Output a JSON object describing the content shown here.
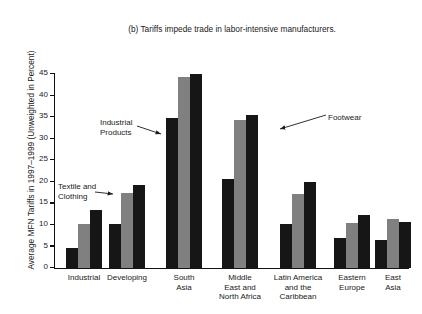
{
  "chart_data": {
    "type": "bar",
    "title": "(b) Tariffs impede trade in labor-intensive manufacturers.",
    "xlabel": "",
    "ylabel": "Average MFN Tariffs in 1997–1999 (Unweighted in Percent)",
    "ylim": [
      0,
      45
    ],
    "ytick_step": 5,
    "yticks": [
      45,
      40,
      35,
      30,
      25,
      20,
      15,
      10,
      5,
      0
    ],
    "ytick_labels": [
      "45",
      "40",
      "35",
      "30",
      "25",
      "20",
      "15",
      "10",
      "5",
      "0"
    ],
    "grid": false,
    "legend_position": "none-annotated",
    "categories": [
      "Industrial",
      "Developing",
      "South Asia",
      "Middle East and North Africa",
      "Latin America and the Caribbean",
      "Eastern Europe",
      "East Asia"
    ],
    "category_label_lines": [
      [
        "Industrial"
      ],
      [
        "Developing"
      ],
      [
        "South",
        "Asia"
      ],
      [
        "Middle",
        "East and",
        "North Africa"
      ],
      [
        "Latin America",
        "and the",
        "Caribbean"
      ],
      [
        "Eastern",
        "Europe"
      ],
      [
        "East",
        "Asia"
      ]
    ],
    "series": [
      {
        "name": "Industrial Products",
        "color": "#161616",
        "values": [
          4.5,
          10.0,
          34.8,
          20.6,
          10.0,
          6.8,
          6.3
        ]
      },
      {
        "name": "Textile and Clothing",
        "color": "#808080",
        "values": [
          10.1,
          17.4,
          44.2,
          34.3,
          17.0,
          10.4,
          11.2
        ]
      },
      {
        "name": "Footwear",
        "color": "#161616",
        "values": [
          13.3,
          19.1,
          45.0,
          35.4,
          19.9,
          12.3,
          10.6
        ]
      }
    ],
    "annotations": [
      {
        "text_lines": [
          "Industrial",
          "Products"
        ],
        "points_to_series": "Industrial Products",
        "points_to_category": "South Asia"
      },
      {
        "text_lines": [
          "Textile and",
          "Clothing"
        ],
        "points_to_series": "Textile and Clothing",
        "points_to_category": "Developing"
      },
      {
        "text_lines": [
          "Footwear"
        ],
        "points_to_series": "Footwear",
        "points_to_category": "Middle East and North Africa"
      }
    ],
    "colors": {
      "dark_bar": "#161616",
      "gray_bar": "#808080",
      "axis": "#111111",
      "background": "#ffffff",
      "text": "#1a1a1a"
    }
  }
}
